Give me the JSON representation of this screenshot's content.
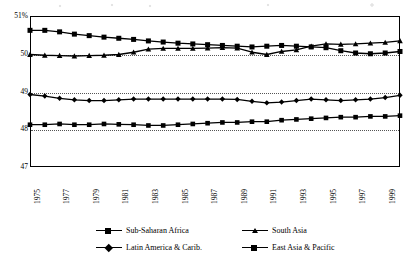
{
  "chart_data": {
    "type": "line",
    "title": "",
    "xlabel": "",
    "ylabel": "",
    "ylim": [
      47,
      51
    ],
    "yticks": [
      47,
      48,
      49,
      50,
      51
    ],
    "ytick_labels": [
      "47",
      "48",
      "49",
      "50",
      "51%"
    ],
    "grid": "horizontal-dotted",
    "legend_position": "below-plot",
    "x": [
      1975,
      1976,
      1977,
      1978,
      1979,
      1980,
      1981,
      1982,
      1983,
      1984,
      1985,
      1986,
      1987,
      1988,
      1989,
      1990,
      1991,
      1992,
      1993,
      1994,
      1995,
      1996,
      1997,
      1998,
      1999,
      2000
    ],
    "xtick_labels": [
      "1975",
      "1977",
      "1979",
      "1981",
      "1983",
      "1985",
      "1987",
      "1989",
      "1991",
      "1993",
      "1995",
      "1997",
      "1999"
    ],
    "series": [
      {
        "name": "Sub-Saharan Africa",
        "marker": "square",
        "values": [
          50.62,
          50.62,
          50.58,
          50.52,
          50.48,
          50.44,
          50.41,
          50.38,
          50.34,
          50.31,
          50.28,
          50.26,
          50.24,
          50.22,
          50.2,
          50.18,
          50.2,
          50.22,
          50.2,
          50.18,
          50.16,
          50.08,
          50.02,
          50.0,
          50.02,
          50.06
        ]
      },
      {
        "name": "South Asia",
        "marker": "triangle",
        "values": [
          49.98,
          49.96,
          49.95,
          49.94,
          49.95,
          49.96,
          49.98,
          50.04,
          50.12,
          50.14,
          50.14,
          50.14,
          50.15,
          50.16,
          50.15,
          50.04,
          49.98,
          50.06,
          50.1,
          50.2,
          50.26,
          50.25,
          50.26,
          50.28,
          50.3,
          50.34
        ]
      },
      {
        "name": "Latin America & Carib.",
        "marker": "diamond",
        "values": [
          48.92,
          48.88,
          48.82,
          48.78,
          48.76,
          48.76,
          48.78,
          48.8,
          48.8,
          48.8,
          48.8,
          48.8,
          48.8,
          48.8,
          48.79,
          48.74,
          48.7,
          48.72,
          48.76,
          48.8,
          48.78,
          48.76,
          48.78,
          48.8,
          48.84,
          48.9
        ]
      },
      {
        "name": "East Asia & Pacific",
        "marker": "square-small",
        "values": [
          48.12,
          48.12,
          48.14,
          48.12,
          48.12,
          48.14,
          48.13,
          48.12,
          48.1,
          48.1,
          48.12,
          48.14,
          48.16,
          48.18,
          48.18,
          48.2,
          48.2,
          48.24,
          48.26,
          48.28,
          48.3,
          48.32,
          48.32,
          48.34,
          48.34,
          48.36
        ]
      }
    ]
  },
  "legend": {
    "entries": [
      {
        "label": "Sub-Saharan Africa"
      },
      {
        "label": "South Asia"
      },
      {
        "label": "Latin America & Carib."
      },
      {
        "label": "East Asia & Pacific"
      }
    ]
  },
  "colors": {
    "line": "#000000",
    "grid": "#555555",
    "frame": "#000000",
    "background": "#ffffff"
  }
}
